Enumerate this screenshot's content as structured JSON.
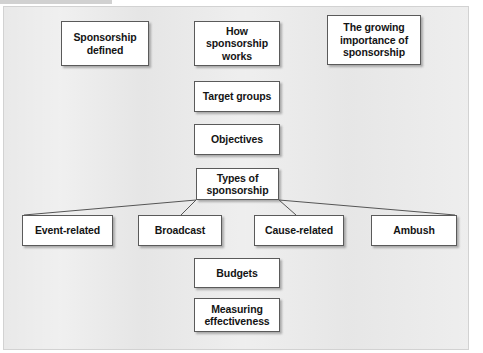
{
  "slide": {
    "title_implied": "Sponsorship",
    "background_color": "#e9e9e9",
    "frame_border_color": "#d2d2d2",
    "node_fill": "#ffffff",
    "node_border": "#5a5a5a",
    "text_color": "#141414",
    "link_color": "#555555"
  },
  "nodes": [
    {
      "id": "sponsorship-defined",
      "label": "Sponsorship\ndefined",
      "x": 61,
      "y": 21,
      "w": 88,
      "h": 45
    },
    {
      "id": "how-sponsorship-works",
      "label": "How\nsponsorship\nworks",
      "x": 194,
      "y": 21,
      "w": 86,
      "h": 45
    },
    {
      "id": "growing-importance",
      "label": "The growing\nimportance of\nsponsorship",
      "x": 327,
      "y": 15,
      "w": 94,
      "h": 50
    },
    {
      "id": "target-groups",
      "label": "Target groups",
      "x": 194,
      "y": 81,
      "w": 86,
      "h": 31
    },
    {
      "id": "objectives",
      "label": "Objectives",
      "x": 194,
      "y": 124,
      "w": 86,
      "h": 31
    },
    {
      "id": "types-of-sponsorship",
      "label": "Types of\nsponsorship",
      "x": 196,
      "y": 168,
      "w": 83,
      "h": 32
    },
    {
      "id": "event-related",
      "label": "Event-related",
      "x": 22,
      "y": 215,
      "w": 91,
      "h": 31
    },
    {
      "id": "broadcast",
      "label": "Broadcast",
      "x": 138,
      "y": 215,
      "w": 84,
      "h": 31
    },
    {
      "id": "cause-related",
      "label": "Cause-related",
      "x": 254,
      "y": 215,
      "w": 90,
      "h": 31
    },
    {
      "id": "ambush",
      "label": "Ambush",
      "x": 371,
      "y": 215,
      "w": 86,
      "h": 31
    },
    {
      "id": "budgets",
      "label": "Budgets",
      "x": 194,
      "y": 258,
      "w": 86,
      "h": 30
    },
    {
      "id": "measuring-effectiveness",
      "label": "Measuring\neffectiveness",
      "x": 194,
      "y": 298,
      "w": 86,
      "h": 34
    }
  ],
  "links": [
    {
      "from": "types-of-sponsorship",
      "to": "event-related",
      "x1": 196,
      "y1": 200,
      "x2": 24,
      "y2": 215
    },
    {
      "from": "types-of-sponsorship",
      "to": "broadcast",
      "x1": 196,
      "y1": 200,
      "x2": 181,
      "y2": 215
    },
    {
      "from": "types-of-sponsorship",
      "to": "cause-related",
      "x1": 279,
      "y1": 200,
      "x2": 296,
      "y2": 215
    },
    {
      "from": "types-of-sponsorship",
      "to": "ambush",
      "x1": 279,
      "y1": 200,
      "x2": 455,
      "y2": 215
    }
  ]
}
